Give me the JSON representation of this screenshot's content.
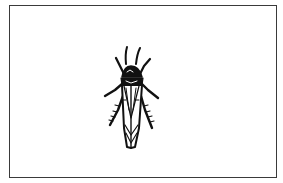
{
  "figure": {
    "border_color": "#3a3a3a",
    "ink_color": "#111111",
    "background_color": "#ffffff"
  }
}
